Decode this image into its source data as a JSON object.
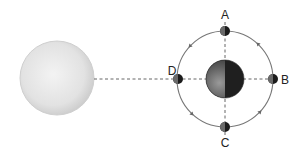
{
  "diagram": {
    "sun": {
      "name": "Sun",
      "color": "#e4e4e4"
    },
    "earth": {
      "name": "Earth",
      "lit_color": "#7a7a7a",
      "dark_color": "#222222"
    },
    "orbit": {
      "color": "#777777",
      "direction": "counterclockwise"
    },
    "moon_positions": [
      {
        "id": "A",
        "label": "A",
        "position": "top"
      },
      {
        "id": "B",
        "label": "B",
        "position": "right"
      },
      {
        "id": "C",
        "label": "C",
        "position": "bottom"
      },
      {
        "id": "D",
        "label": "D",
        "position": "left"
      }
    ],
    "guide_line_style": "dashed",
    "guide_line_color": "#555555"
  }
}
